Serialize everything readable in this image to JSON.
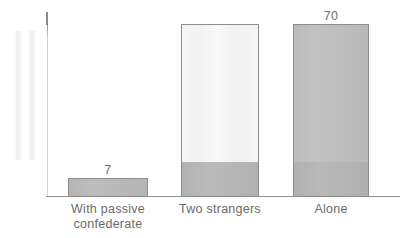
{
  "chart_data": {
    "type": "bar",
    "title": "",
    "subtitle": "",
    "xlabel": "",
    "ylabel": "",
    "categories": [
      "With passive confederate",
      "Two strangers",
      "Alone"
    ],
    "values": [
      7,
      75,
      70
    ],
    "value_labels": [
      "7",
      "",
      "70"
    ],
    "ylim": [
      0,
      80
    ],
    "grid": false,
    "legend": null,
    "series": [
      {
        "name": "Percent helping",
        "values": [
          7,
          75,
          70
        ]
      }
    ]
  },
  "axes": {
    "y_axis_visible": true,
    "x_axis_visible": true,
    "y_tick_labels": [],
    "x_tick_labels": [
      "With passive confederate",
      "Two strangers",
      "Alone"
    ]
  },
  "bars": [
    {
      "key": "passive-confederate",
      "label_line1": "With passive",
      "label_line2": "confederate",
      "value_label": "7",
      "fill": "#b8b8b8",
      "lower_band_fill": "#b8b8b8",
      "stroke": "#8d8d8d"
    },
    {
      "key": "two-strangers",
      "label_line1": "Two strangers",
      "label_line2": "",
      "value_label": "",
      "fill": "#f5f5f5",
      "lower_band_fill": "#b6b6b6",
      "stroke": "#8d8d8d"
    },
    {
      "key": "alone",
      "label_line1": "Alone",
      "label_line2": "",
      "value_label": "70",
      "fill": "#bdbdbd",
      "lower_band_fill": "#b4b4b4",
      "stroke": "#8d8d8d"
    }
  ],
  "colors": {
    "background": "#ffffff",
    "axis_line": "#8f8f8f",
    "bar_stroke": "#8d8d8d",
    "bar_fill_light": "#f5f5f5",
    "bar_fill_medium": "#bdbdbd",
    "bar_fill_band": "#b6b6b6",
    "text": "#6b6b6b",
    "ghost_strip": "#f1f1f1"
  }
}
